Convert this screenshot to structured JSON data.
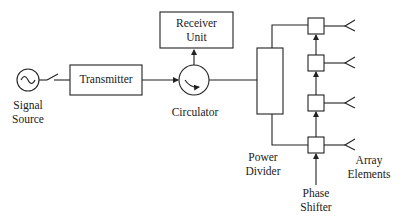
{
  "diagram": {
    "blocks": {
      "signal_source": {
        "line1": "Signal",
        "line2": "Source"
      },
      "transmitter": {
        "label": "Transmitter"
      },
      "receiver_unit": {
        "line1": "Receiver",
        "line2": "Unit"
      },
      "circulator": {
        "label": "Circulator"
      },
      "power_divider": {
        "line1": "Power",
        "line2": "Divider"
      },
      "phase_shifter": {
        "line1": "Phase",
        "line2": "Shifter"
      },
      "array_elements": {
        "line1": "Array",
        "line2": "Elements"
      }
    },
    "phase_shifter_count": 4,
    "array_element_count": 4,
    "stroke_color": "#222222"
  }
}
